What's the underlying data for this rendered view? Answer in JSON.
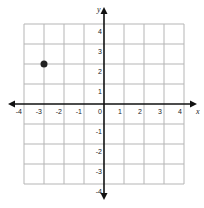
{
  "chart_data": {
    "type": "scatter",
    "title": "",
    "xlabel": "x",
    "ylabel": "y",
    "xlim": [
      -4,
      4
    ],
    "ylim": [
      -4,
      4
    ],
    "grid": true,
    "x_ticks": [
      "-4",
      "-3",
      "-2",
      "-1",
      "0",
      "1",
      "2",
      "3",
      "4"
    ],
    "y_ticks": [
      "4",
      "3",
      "2",
      "1",
      "-1",
      "-2",
      "-3",
      "-4"
    ],
    "points": [
      {
        "x": -3,
        "y": 2
      }
    ],
    "colors": {
      "grid": "#b5b5b5",
      "axis": "#111111",
      "point": "#222222"
    }
  }
}
